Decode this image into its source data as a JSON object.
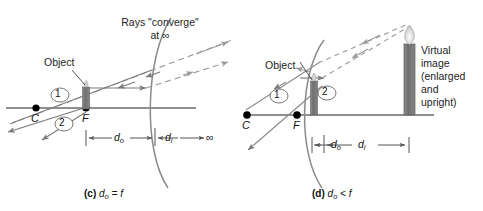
{
  "figure": {
    "type": "optics-ray-diagram",
    "panels": [
      {
        "id": "c",
        "caption_letter": "(c)",
        "caption_text": "dₒ = f",
        "caption_plain": "(c) do = f",
        "annotations": {
          "header_line1": "Rays \"converge\"",
          "header_line2": "at ∞",
          "object_label": "Object",
          "ray1_label": "1",
          "ray2_label": "2",
          "point_c": "C",
          "point_f": "F",
          "dim_do": "d",
          "dim_do_sub": "o",
          "dim_di": "d",
          "dim_di_sub": "i",
          "infinity": "∞"
        }
      },
      {
        "id": "d",
        "caption_letter": "(d)",
        "caption_text": "dₒ < f",
        "caption_plain": "(d) do < f",
        "annotations": {
          "object_label": "Object",
          "ray1_label": "1",
          "ray2_label": "2",
          "point_c": "C",
          "point_f": "F",
          "virtual_image_line1": "Virtual",
          "virtual_image_line2": "image",
          "virtual_image_line3": "(enlarged",
          "virtual_image_line4": "and",
          "virtual_image_line5": "upright)",
          "dim_do": "d",
          "dim_do_sub": "o",
          "dim_di": "d",
          "dim_di_sub": "i"
        }
      }
    ],
    "colors": {
      "background": "#ffffff",
      "axis": "#6b6b6b",
      "mirror": "#8a8a8a",
      "ray_solid": "#7a7a7a",
      "ray_dashed": "#9a9a9a",
      "point_dot": "#000000",
      "object_body": "#7d7d7d",
      "image_body": "#7d7d7d",
      "flame": "#d8d8d8",
      "text": "#1a1a1a",
      "dim_line": "#6b6b6b"
    }
  }
}
